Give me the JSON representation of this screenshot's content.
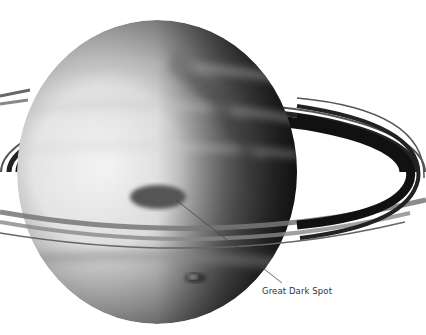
{
  "diagram": {
    "annotations": [
      {
        "text": "Great Dark Spot",
        "x": 262,
        "y": 290,
        "pointer_from": [
          282,
          283
        ],
        "pointer_to": [
          176,
          200
        ]
      }
    ],
    "colors": {
      "background": "#ffffff",
      "planet_light": "#f4f4f4",
      "planet_dark": "#2a2a2a",
      "ring_dark": "#111111",
      "label": "#333333"
    }
  }
}
